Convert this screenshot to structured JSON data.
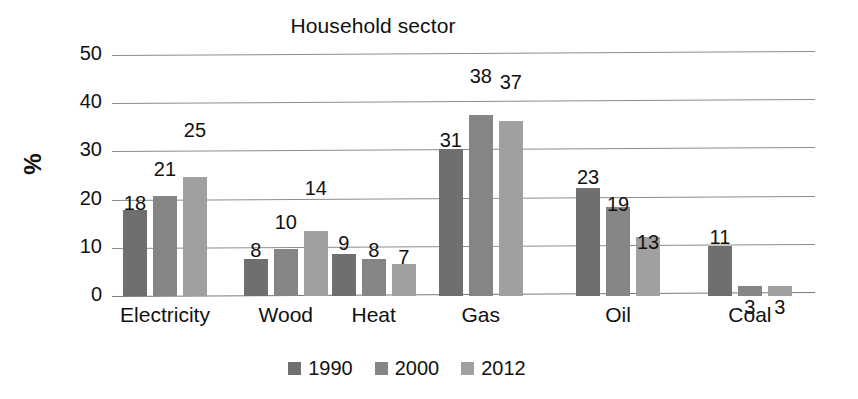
{
  "chart_data": {
    "type": "bar",
    "title": "Household sector",
    "xlabel": "",
    "ylabel": "%",
    "ylim": [
      0,
      50
    ],
    "yticks": [
      0,
      10,
      20,
      30,
      40,
      50
    ],
    "grid": true,
    "legend_position": "bottom",
    "categories": [
      "Electricity",
      "Wood",
      "Heat",
      "Gas",
      "Oil",
      "Coal"
    ],
    "series": [
      {
        "name": "1990",
        "color": "#6f6f6f",
        "values": [
          18,
          8,
          9,
          31,
          23,
          11
        ]
      },
      {
        "name": "2000",
        "color": "#858585",
        "values": [
          21,
          10,
          8,
          38,
          19,
          3
        ]
      },
      {
        "name": "2012",
        "color": "#a0a0a0",
        "values": [
          25,
          14,
          7,
          37,
          13,
          3
        ]
      }
    ]
  },
  "axis": {
    "y_tick_labels": [
      "50",
      "40",
      "30",
      "20",
      "10",
      "0"
    ],
    "y_title": "%"
  },
  "legend": {
    "items": [
      {
        "label": "1990",
        "color": "#6f6f6f"
      },
      {
        "label": "2000",
        "color": "#858585"
      },
      {
        "label": "2012",
        "color": "#a0a0a0"
      }
    ]
  }
}
